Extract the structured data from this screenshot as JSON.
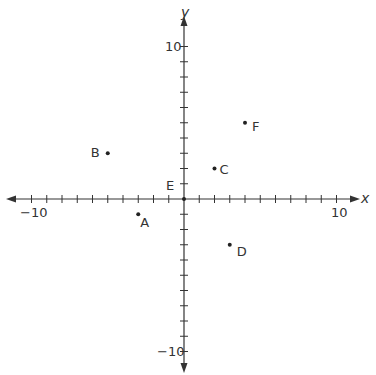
{
  "chart_data": {
    "type": "scatter",
    "title": "",
    "xlabel": "x",
    "ylabel": "y",
    "xlim": [
      -11,
      11
    ],
    "ylim": [
      -11,
      11
    ],
    "grid": false,
    "tick_step": 1,
    "tick_labels": {
      "x": [
        {
          "value": -10,
          "label": "−10"
        },
        {
          "value": 10,
          "label": "10"
        }
      ],
      "y": [
        {
          "value": 10,
          "label": "10"
        },
        {
          "value": -10,
          "label": "−10"
        }
      ]
    },
    "points": [
      {
        "label": "A",
        "x": -3,
        "y": -1
      },
      {
        "label": "B",
        "x": -5,
        "y": 3
      },
      {
        "label": "C",
        "x": 2,
        "y": 2
      },
      {
        "label": "D",
        "x": 3,
        "y": -3
      },
      {
        "label": "E",
        "x": 0,
        "y": 0
      },
      {
        "label": "F",
        "x": 4,
        "y": 5
      }
    ]
  },
  "axes": {
    "x_label": "x",
    "y_label": "y"
  },
  "colors": {
    "axis": "#333333",
    "point": "#222222",
    "background": "#ffffff"
  }
}
